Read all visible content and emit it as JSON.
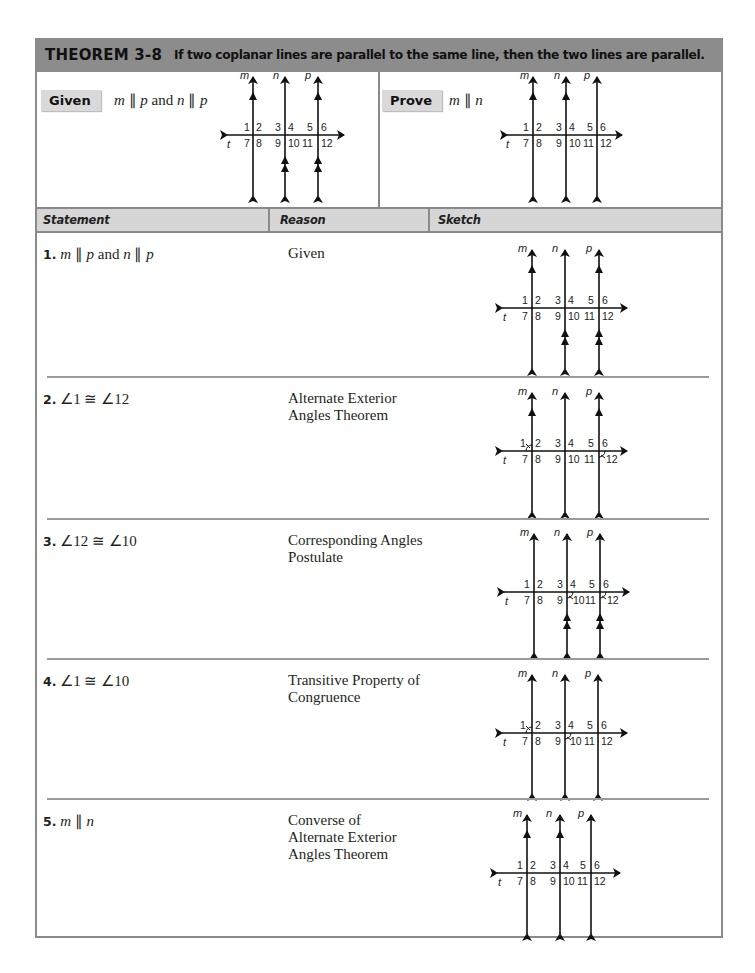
{
  "theorem": {
    "number": "THEOREM 3-8",
    "statement": "If two coplanar lines are parallel to the same line, then the two lines are parallel."
  },
  "given": {
    "label": "Given",
    "text": "m ∥ p and n ∥ p"
  },
  "prove": {
    "label": "Prove",
    "text": "m ∥ n"
  },
  "table": {
    "headers": [
      "Statement",
      "Reason",
      "Sketch"
    ],
    "rows": [
      {
        "number": "1.",
        "statement": "m ∥ p and n ∥ p",
        "reason": "Given"
      },
      {
        "number": "2.",
        "statement": "∠1 ≅ ∠12",
        "reason": "Alternate Exterior Angles Theorem"
      },
      {
        "number": "3.",
        "statement": "∠12 ≅ ∠10",
        "reason": "Corresponding Angles Postulate"
      },
      {
        "number": "4.",
        "statement": "∠1 ≅ ∠10",
        "reason": "Transitive Property of Congruence"
      },
      {
        "number": "5.",
        "statement": "m ∥ n",
        "reason": "Converse of Alternate Exterior Angles Theorem"
      }
    ]
  },
  "diagram": {
    "line_labels": [
      "m",
      "n",
      "p",
      "t"
    ],
    "angle_numbers": [
      "1",
      "2",
      "3",
      "4",
      "5",
      "6",
      "7",
      "8",
      "9",
      "10",
      "11",
      "12"
    ]
  },
  "sketches": {
    "given": {
      "single_marks": [
        "m",
        "p"
      ],
      "double_marks": [
        "n",
        "p"
      ],
      "arcs": []
    },
    "prove": {
      "single_marks": [
        "m",
        "n"
      ],
      "double_marks": [],
      "arcs": []
    },
    "step1": {
      "single_marks": [
        "m",
        "p"
      ],
      "double_marks": [
        "n",
        "p"
      ],
      "arcs": []
    },
    "step2": {
      "single_marks": [
        "m",
        "p"
      ],
      "double_marks": [],
      "arcs": [
        "1",
        "12"
      ]
    },
    "step3": {
      "single_marks": [],
      "double_marks": [
        "n",
        "p"
      ],
      "arcs": [
        "10",
        "12"
      ]
    },
    "step4": {
      "single_marks": [],
      "double_marks": [],
      "arcs": [
        "1",
        "10"
      ]
    },
    "step5": {
      "single_marks": [
        "m",
        "n"
      ],
      "double_marks": [],
      "arcs": []
    }
  },
  "colors": {
    "theorem_bar": "#8c8c8c",
    "label_tag": "#d9d9d9",
    "table_header": "#d6d6d6",
    "border": "#8a8a8a"
  }
}
